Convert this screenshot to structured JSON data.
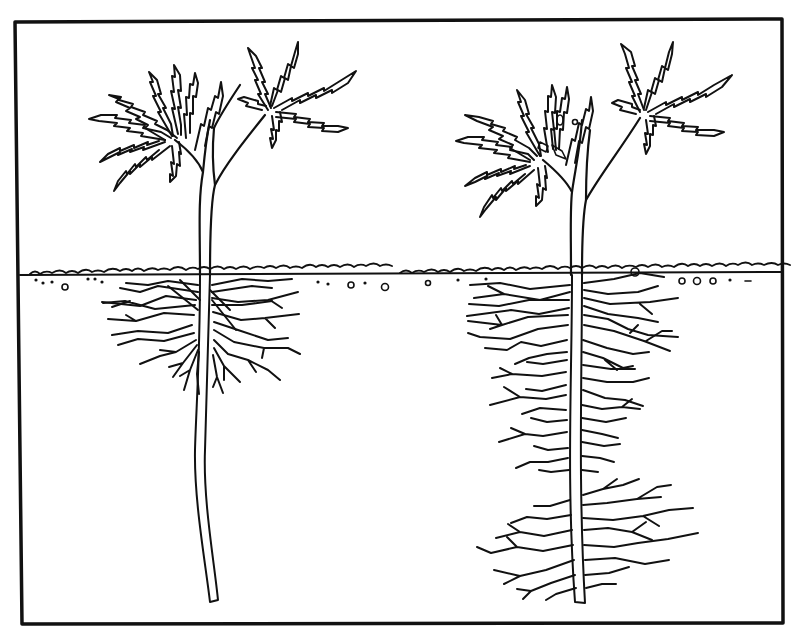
{
  "figure": {
    "colors": {
      "ink": "#111111",
      "paper": "#ffffff"
    },
    "frame": {
      "x1": 15,
      "y1": 20,
      "x2": 783,
      "y2": 623
    },
    "soil_line_y": 275,
    "plants": [
      {
        "id": "left",
        "stem_x": 205,
        "root_type": "shallow-cluster",
        "root_bottom_y": 602
      },
      {
        "id": "right",
        "stem_x": 575,
        "root_type": "full-length-branching",
        "root_bottom_y": 603
      }
    ]
  }
}
